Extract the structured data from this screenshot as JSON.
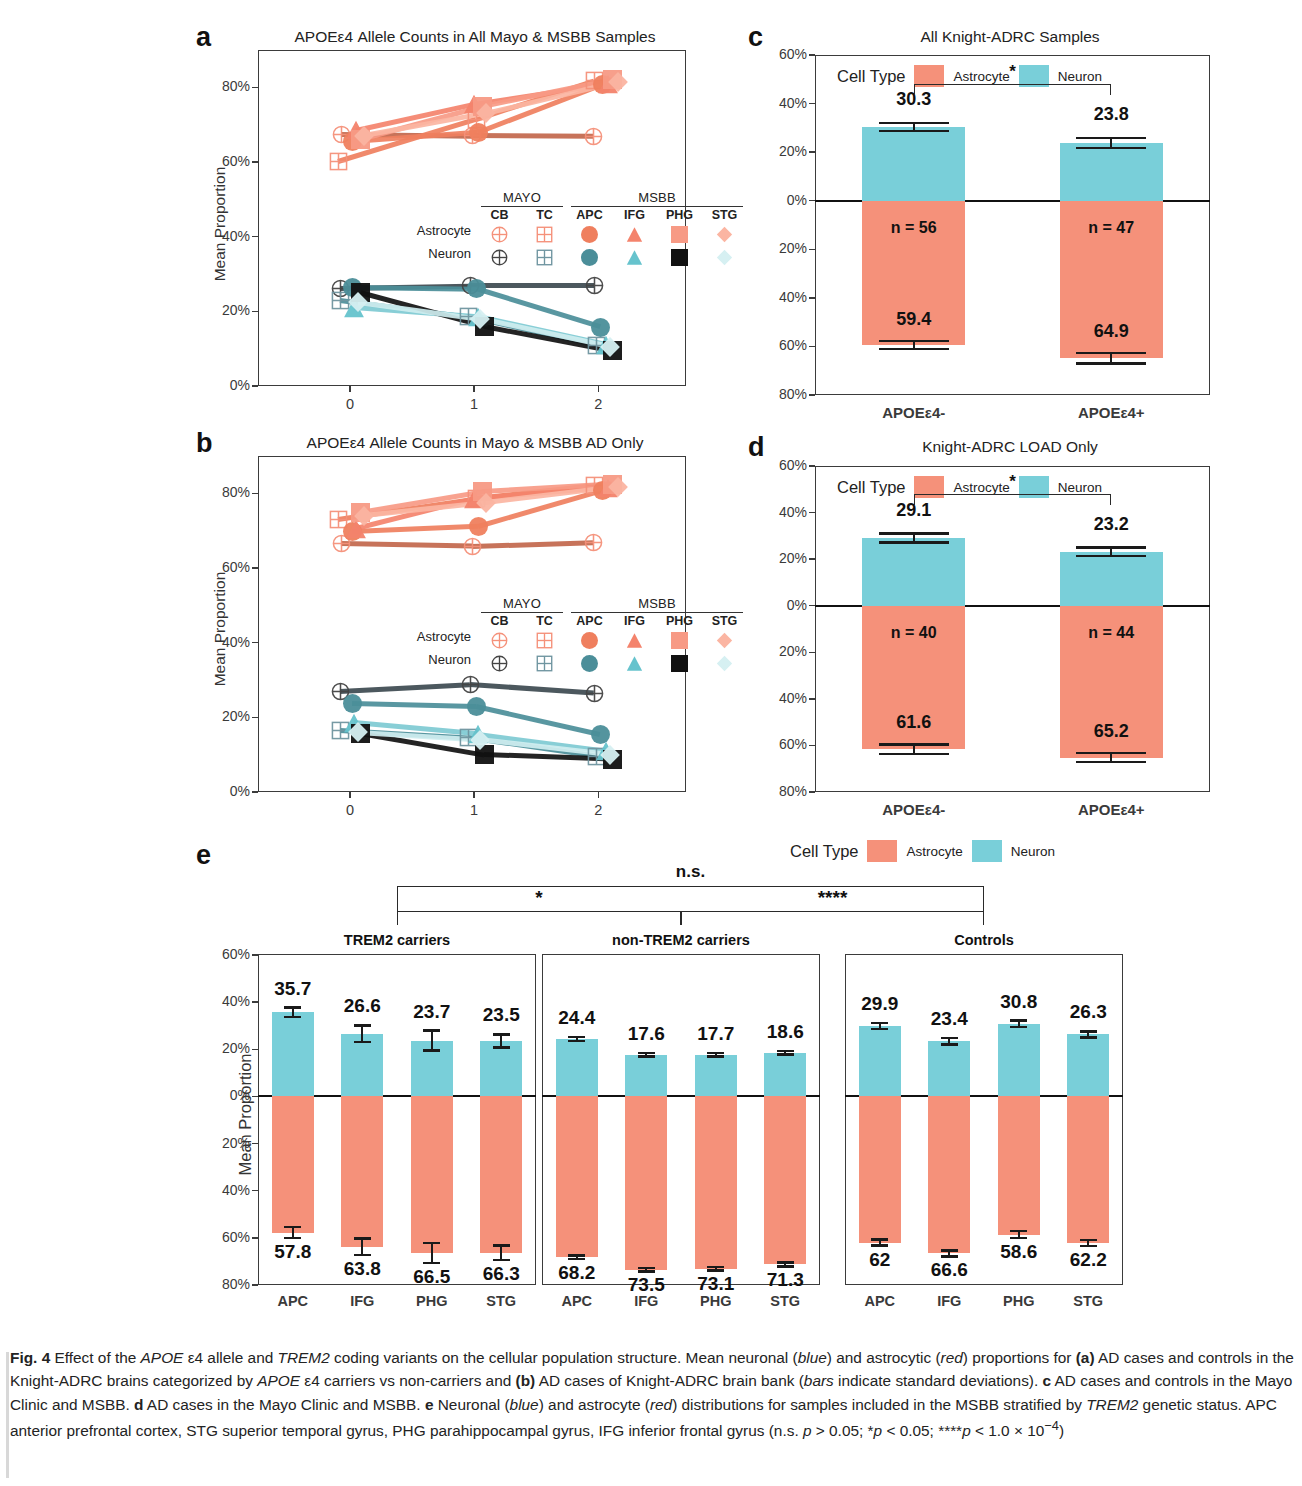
{
  "figure": {
    "label": "Fig. 4",
    "caption_runs": [
      {
        "t": "Fig. 4",
        "s": "b"
      },
      {
        "t": " Effect of the ",
        "s": "n"
      },
      {
        "t": "APOE",
        "s": "i"
      },
      {
        "t": " ε4 allele and ",
        "s": "n"
      },
      {
        "t": "TREM2",
        "s": "i"
      },
      {
        "t": " coding variants on the cellular population structure. Mean neuronal (",
        "s": "n"
      },
      {
        "t": "blue",
        "s": "i"
      },
      {
        "t": ") and astrocytic (",
        "s": "n"
      },
      {
        "t": "red",
        "s": "i"
      },
      {
        "t": ") proportions for ",
        "s": "n"
      },
      {
        "t": "(a)",
        "s": "b"
      },
      {
        "t": " AD cases and controls in the Knight-ADRC brains categorized by ",
        "s": "n"
      },
      {
        "t": "APOE",
        "s": "i"
      },
      {
        "t": " ε4 carriers vs non-carriers and ",
        "s": "n"
      },
      {
        "t": "(b)",
        "s": "b"
      },
      {
        "t": " AD cases of Knight-ADRC brain bank (",
        "s": "n"
      },
      {
        "t": "bars",
        "s": "i"
      },
      {
        "t": " indicate standard deviations). ",
        "s": "n"
      },
      {
        "t": "c",
        "s": "b"
      },
      {
        "t": " AD cases and controls in the Mayo Clinic and MSBB. ",
        "s": "n"
      },
      {
        "t": "d",
        "s": "b"
      },
      {
        "t": " AD cases in the Mayo Clinic and MSBB. ",
        "s": "n"
      },
      {
        "t": "e",
        "s": "b"
      },
      {
        "t": " Neuronal (",
        "s": "n"
      },
      {
        "t": "blue",
        "s": "i"
      },
      {
        "t": ") and astrocyte (",
        "s": "n"
      },
      {
        "t": "red",
        "s": "i"
      },
      {
        "t": ") distributions for samples included in the MSBB stratified by ",
        "s": "n"
      },
      {
        "t": "TREM2",
        "s": "i"
      },
      {
        "t": " genetic status. APC anterior prefrontal cortex, STG superior temporal gyrus, PHG parahippocampal gyrus, IFG inferior frontal gyrus (n.s. ",
        "s": "n"
      },
      {
        "t": "p",
        "s": "i"
      },
      {
        "t": " > 0.05; *",
        "s": "n"
      },
      {
        "t": "p",
        "s": "i"
      },
      {
        "t": " < 0.05; ****",
        "s": "n"
      },
      {
        "t": "p",
        "s": "i"
      },
      {
        "t": " < 1.0 × 10",
        "s": "n"
      },
      {
        "t": "−4",
        "s": "sup"
      },
      {
        "t": ")",
        "s": "n"
      }
    ]
  },
  "colors": {
    "astrocyte": "#f5917a",
    "neuron": "#79cfd9",
    "astrocyte_dark": "#d96a4e",
    "neuron_dark": "#3f8f9c",
    "black": "#111111",
    "axis": "#3b3b3b"
  },
  "panel_a": {
    "letter": "a",
    "title": "APOEε4 Allele Counts in All Mayo & MSBB Samples",
    "ylabel": "Mean Proportion",
    "y_ticks": [
      "80%",
      "60%",
      "40%",
      "20%",
      "0%"
    ],
    "x_ticks": [
      "0",
      "1",
      "2"
    ],
    "legend": {
      "groups": [
        "MAYO",
        "MSBB"
      ],
      "columns": [
        "CB",
        "TC",
        "APC",
        "IFG",
        "PHG",
        "STG"
      ],
      "rows": [
        "Astrocyte",
        "Neuron"
      ]
    },
    "chart_data": {
      "type": "line",
      "title": "APOEε4 Allele Counts in All Mayo & MSBB Samples",
      "xlabel": "",
      "ylabel": "Mean Proportion",
      "x": [
        0,
        1,
        2
      ],
      "ylim": [
        0,
        90
      ],
      "grid": false,
      "series": [
        {
          "name": "Astrocyte MAYO CB",
          "marker": "crossed-circle",
          "cell": "Astrocyte",
          "values": [
            67.5,
            67.0,
            66.8
          ]
        },
        {
          "name": "Astrocyte MAYO TC",
          "marker": "crossed-square",
          "cell": "Astrocyte",
          "values": [
            60.2,
            71.5,
            81.8
          ]
        },
        {
          "name": "Astrocyte MSBB APC",
          "marker": "circle",
          "cell": "Astrocyte",
          "values": [
            65.5,
            68.0,
            80.8
          ]
        },
        {
          "name": "Astrocyte MSBB IFG",
          "marker": "triangle",
          "cell": "Astrocyte",
          "values": [
            68.5,
            75.5,
            81.0
          ]
        },
        {
          "name": "Astrocyte MSBB PHG",
          "marker": "square",
          "cell": "Astrocyte",
          "values": [
            66.0,
            74.8,
            82.0
          ]
        },
        {
          "name": "Astrocyte MSBB STG",
          "marker": "diamond",
          "cell": "Astrocyte",
          "values": [
            67.0,
            73.0,
            81.5
          ]
        },
        {
          "name": "Neuron MAYO CB",
          "marker": "crossed-circle",
          "cell": "Neuron",
          "values": [
            26.2,
            26.8,
            26.8
          ]
        },
        {
          "name": "Neuron MAYO TC",
          "marker": "crossed-square",
          "cell": "Neuron",
          "values": [
            23.0,
            18.5,
            10.8
          ]
        },
        {
          "name": "Neuron MSBB APC",
          "marker": "circle",
          "cell": "Neuron",
          "values": [
            26.5,
            26.0,
            15.8
          ]
        },
        {
          "name": "Neuron MSBB IFG",
          "marker": "triangle",
          "cell": "Neuron",
          "values": [
            21.0,
            18.5,
            11.0
          ]
        },
        {
          "name": "Neuron MSBB PHG",
          "marker": "square",
          "cell": "Neuron",
          "values": [
            25.0,
            16.0,
            9.5
          ]
        },
        {
          "name": "Neuron MSBB STG",
          "marker": "diamond",
          "cell": "Neuron",
          "values": [
            22.5,
            18.0,
            10.5
          ]
        }
      ]
    }
  },
  "panel_b": {
    "letter": "b",
    "title": "APOEε4 Allele Counts in Mayo & MSBB AD Only",
    "ylabel": "Mean Proportion",
    "y_ticks": [
      "80%",
      "60%",
      "40%",
      "20%",
      "0%"
    ],
    "x_ticks": [
      "0",
      "1",
      "2"
    ],
    "legend": {
      "groups": [
        "MAYO",
        "MSBB"
      ],
      "columns": [
        "CB",
        "TC",
        "APC",
        "IFG",
        "PHG",
        "STG"
      ],
      "rows": [
        "Astrocyte",
        "Neuron"
      ]
    },
    "chart_data": {
      "type": "line",
      "title": "APOEε4 Allele Counts in Mayo & MSBB AD Only",
      "xlabel": "",
      "ylabel": "Mean Proportion",
      "x": [
        0,
        1,
        2
      ],
      "ylim": [
        0,
        90
      ],
      "grid": false,
      "series": [
        {
          "name": "Astrocyte MAYO CB",
          "marker": "crossed-circle",
          "cell": "Astrocyte",
          "values": [
            66.5,
            65.8,
            66.8
          ]
        },
        {
          "name": "Astrocyte MAYO TC",
          "marker": "crossed-square",
          "cell": "Astrocyte",
          "values": [
            73.0,
            78.5,
            82.0
          ]
        },
        {
          "name": "Astrocyte MSBB APC",
          "marker": "circle",
          "cell": "Astrocyte",
          "values": [
            69.8,
            71.2,
            80.8
          ]
        },
        {
          "name": "Astrocyte MSBB IFG",
          "marker": "triangle",
          "cell": "Astrocyte",
          "values": [
            70.5,
            78.5,
            81.5
          ]
        },
        {
          "name": "Astrocyte MSBB PHG",
          "marker": "square",
          "cell": "Astrocyte",
          "values": [
            75.0,
            80.5,
            82.5
          ]
        },
        {
          "name": "Astrocyte MSBB STG",
          "marker": "diamond",
          "cell": "Astrocyte",
          "values": [
            74.0,
            77.5,
            81.8
          ]
        },
        {
          "name": "Neuron MAYO CB",
          "marker": "crossed-circle",
          "cell": "Neuron",
          "values": [
            27.0,
            28.8,
            26.5
          ]
        },
        {
          "name": "Neuron MAYO TC",
          "marker": "crossed-square",
          "cell": "Neuron",
          "values": [
            16.5,
            14.5,
            9.5
          ]
        },
        {
          "name": "Neuron MSBB APC",
          "marker": "circle",
          "cell": "Neuron",
          "values": [
            23.8,
            23.0,
            15.5
          ]
        },
        {
          "name": "Neuron MSBB IFG",
          "marker": "triangle",
          "cell": "Neuron",
          "values": [
            18.5,
            15.5,
            11.0
          ]
        },
        {
          "name": "Neuron MSBB PHG",
          "marker": "square",
          "cell": "Neuron",
          "values": [
            15.8,
            10.0,
            8.8
          ]
        },
        {
          "name": "Neuron MSBB STG",
          "marker": "diamond",
          "cell": "Neuron",
          "values": [
            16.0,
            14.0,
            10.0
          ]
        }
      ]
    }
  },
  "panel_c": {
    "letter": "c",
    "title": "All Knight-ADRC Samples",
    "legend": {
      "title": "Cell Type",
      "items": [
        "Astrocyte",
        "Neuron"
      ]
    },
    "y_ticks_up": [
      "60%",
      "40%",
      "20%",
      "0%"
    ],
    "y_ticks_down": [
      "20%",
      "40%",
      "60%",
      "80%"
    ],
    "significance": "*",
    "chart_data": {
      "type": "bar",
      "title": "All Knight-ADRC Samples",
      "xlabel": "",
      "ylabel": "",
      "categories": [
        "APOEε4-",
        "APOEε4+"
      ],
      "n_labels": [
        "n = 56",
        "n = 47"
      ],
      "ylim": [
        -80,
        60
      ],
      "series": [
        {
          "name": "Neuron",
          "values": [
            30.3,
            23.8
          ],
          "errors": [
            1.6,
            2.0
          ],
          "direction": "up"
        },
        {
          "name": "Astrocyte",
          "values": [
            59.4,
            64.9
          ],
          "errors": [
            1.6,
            2.1
          ],
          "direction": "down"
        }
      ]
    }
  },
  "panel_d": {
    "letter": "d",
    "title": "Knight-ADRC LOAD Only",
    "legend": {
      "title": "Cell Type",
      "items": [
        "Astrocyte",
        "Neuron"
      ]
    },
    "y_ticks_up": [
      "60%",
      "40%",
      "20%",
      "0%"
    ],
    "y_ticks_down": [
      "20%",
      "40%",
      "60%",
      "80%"
    ],
    "significance": "*",
    "chart_data": {
      "type": "bar",
      "title": "Knight-ADRC LOAD Only",
      "xlabel": "",
      "ylabel": "",
      "categories": [
        "APOEε4-",
        "APOEε4+"
      ],
      "n_labels": [
        "n = 40",
        "n = 44"
      ],
      "ylim": [
        -80,
        60
      ],
      "series": [
        {
          "name": "Neuron",
          "values": [
            29.1,
            23.2
          ],
          "errors": [
            1.9,
            1.8
          ],
          "direction": "up"
        },
        {
          "name": "Astrocyte",
          "values": [
            61.6,
            65.2
          ],
          "errors": [
            2.0,
            2.0
          ],
          "direction": "down"
        }
      ]
    }
  },
  "panel_e": {
    "letter": "e",
    "ylabel": "Mean Proportion",
    "legend": {
      "title": "Cell Type",
      "items": [
        "Astrocyte",
        "Neuron"
      ]
    },
    "y_ticks_up": [
      "60%",
      "40%",
      "20%",
      "0%"
    ],
    "y_ticks_down": [
      "20%",
      "40%",
      "60%",
      "80%"
    ],
    "facets": [
      "TREM2 carriers",
      "non-TREM2 carriers",
      "Controls"
    ],
    "brackets": [
      {
        "label": "n.s.",
        "from": "TREM2 carriers",
        "to": "Controls"
      },
      {
        "label": "*",
        "from": "TREM2 carriers",
        "to": "non-TREM2 carriers"
      },
      {
        "label": "****",
        "from": "non-TREM2 carriers",
        "to": "Controls"
      }
    ],
    "chart_data": {
      "type": "bar",
      "title": "",
      "xlabel": "",
      "ylabel": "Mean Proportion",
      "categories": [
        "APC",
        "IFG",
        "PHG",
        "STG"
      ],
      "ylim": [
        -80,
        60
      ],
      "facets": [
        {
          "name": "TREM2 carriers",
          "series": [
            {
              "name": "Neuron",
              "values": [
                35.7,
                26.6,
                23.7,
                23.5
              ],
              "errors": [
                2.0,
                3.5,
                4.2,
                2.8
              ],
              "direction": "up"
            },
            {
              "name": "Astrocyte",
              "values": [
                57.8,
                63.8,
                66.5,
                66.3
              ],
              "errors": [
                2.3,
                3.5,
                4.2,
                3.0
              ],
              "direction": "down"
            }
          ]
        },
        {
          "name": "non-TREM2 carriers",
          "series": [
            {
              "name": "Neuron",
              "values": [
                24.4,
                17.6,
                17.7,
                18.6
              ],
              "errors": [
                0.8,
                0.7,
                0.8,
                0.8
              ],
              "direction": "up"
            },
            {
              "name": "Astrocyte",
              "values": [
                68.2,
                73.5,
                73.1,
                71.3
              ],
              "errors": [
                0.7,
                0.7,
                0.7,
                0.8
              ],
              "direction": "down"
            }
          ]
        },
        {
          "name": "Controls",
          "series": [
            {
              "name": "Neuron",
              "values": [
                29.9,
                23.4,
                30.8,
                26.3
              ],
              "errors": [
                1.3,
                1.3,
                1.4,
                1.3
              ],
              "direction": "up"
            },
            {
              "name": "Astrocyte",
              "values": [
                62.0,
                66.6,
                58.6,
                62.2
              ],
              "errors": [
                1.3,
                1.3,
                1.4,
                1.3
              ],
              "direction": "down"
            }
          ],
          "value_labels": [
            "62",
            "66.6",
            "58.6",
            "62.2"
          ]
        }
      ]
    }
  }
}
